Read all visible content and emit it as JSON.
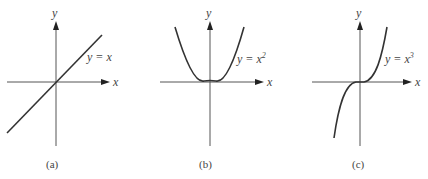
{
  "panels": [
    {
      "id": "a",
      "caption": "(a)",
      "equation": "y = x",
      "exponent": "",
      "x_label": "x",
      "y_label": "y",
      "function": "linear"
    },
    {
      "id": "b",
      "caption": "(b)",
      "equation": "y = x",
      "exponent": "2",
      "x_label": "x",
      "y_label": "y",
      "function": "quadratic"
    },
    {
      "id": "c",
      "caption": "(c)",
      "equation": "y = x",
      "exponent": "3",
      "x_label": "x",
      "y_label": "y",
      "function": "cubic"
    }
  ]
}
